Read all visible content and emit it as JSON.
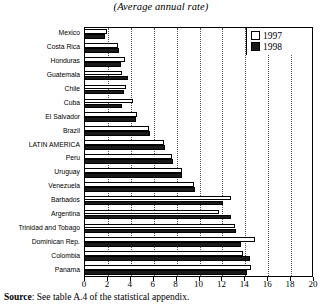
{
  "figure": {
    "title": "(Average annual rate)",
    "source_prefix": "Source",
    "source_text": ": See table A.4 of the statistical appendix."
  },
  "legend": {
    "position": "top-right",
    "entries": [
      {
        "label": "1997",
        "color": "#ffffff",
        "name": "legend-swatch-1997"
      },
      {
        "label": "1998",
        "color": "#1a1a1a",
        "name": "legend-swatch-1998"
      }
    ]
  },
  "axis": {
    "ticks": [
      "0",
      "2",
      "4",
      "6",
      "8",
      "10",
      "12",
      "14",
      "16",
      "18",
      "20"
    ]
  },
  "chart_data": {
    "type": "bar",
    "orientation": "horizontal",
    "title": "(Average annual rate)",
    "xlabel": "",
    "ylabel": "",
    "xlim": [
      0,
      20
    ],
    "xticks": [
      0,
      2,
      4,
      6,
      8,
      10,
      12,
      14,
      16,
      18,
      20
    ],
    "grid": "vertical-dotted",
    "legend_position": "top-right",
    "categories": [
      "Mexico",
      "Costa Rica",
      "Honduras",
      "Guatemala",
      "Chile",
      "Cuba",
      "El Salvador",
      "Brazil",
      "LATIN AMERICA",
      "Peru",
      "Uruguay",
      "Venezuela",
      "Barbados",
      "Argentina",
      "Trinidad and Tobago",
      "Dominican Rep.",
      "Colombia",
      "Panama"
    ],
    "series": [
      {
        "name": "1997",
        "color": "#ffffff",
        "values": [
          2.0,
          3.0,
          3.6,
          3.3,
          3.7,
          4.3,
          4.6,
          5.7,
          7.0,
          7.7,
          8.6,
          9.6,
          12.8,
          11.8,
          13.2,
          14.9,
          13.9,
          14.6
        ]
      },
      {
        "name": "1998",
        "color": "#1a1a1a",
        "values": [
          1.8,
          3.1,
          3.2,
          3.8,
          3.5,
          3.3,
          4.5,
          5.8,
          7.1,
          7.8,
          8.6,
          9.7,
          12.1,
          12.8,
          13.3,
          13.7,
          14.5,
          14.2
        ]
      }
    ]
  }
}
